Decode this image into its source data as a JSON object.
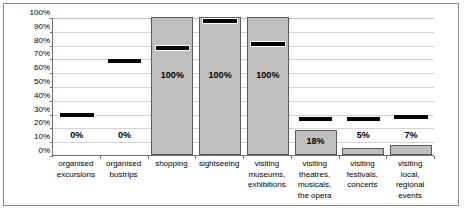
{
  "chart_data": {
    "type": "bar",
    "title": "",
    "xlabel": "",
    "ylabel": "",
    "ylim": [
      0,
      100
    ],
    "grid": true,
    "legend": "none",
    "y_ticks": [
      "0%",
      "10%",
      "20%",
      "30%",
      "40%",
      "50%",
      "60%",
      "70%",
      "80%",
      "90%",
      "100%"
    ],
    "y_tick_values": [
      0,
      10,
      20,
      30,
      40,
      50,
      60,
      70,
      80,
      90,
      100
    ],
    "categories": [
      "organised excursions",
      "organised bustrips",
      "shopping",
      "sightseeing",
      "visiting museums, exhibitions",
      "visiting theatres, musicals, the opera",
      "visiting festivals, concerts",
      "visiting local, regional events"
    ],
    "category_lines": [
      [
        "organised",
        "excursions"
      ],
      [
        "organised",
        "bustrips"
      ],
      [
        "shopping"
      ],
      [
        "sightseeing"
      ],
      [
        "visiting",
        "museums,",
        "exhibitions"
      ],
      [
        "visiting",
        "theatres,",
        "musicals,",
        "the opera"
      ],
      [
        "visiting",
        "festivals,",
        "concerts"
      ],
      [
        "visiting",
        "local,",
        "regional",
        "events"
      ]
    ],
    "series": [
      {
        "name": "bars",
        "type": "bar",
        "color": "#bfbfbf",
        "values": [
          0,
          0,
          100,
          100,
          100,
          18,
          5,
          7
        ],
        "labels": [
          "0%",
          "0%",
          "100%",
          "100%",
          "100%",
          "18%",
          "5%",
          "7%"
        ]
      },
      {
        "name": "markers",
        "type": "marker",
        "color": "#000000",
        "values": [
          30,
          69,
          78,
          98,
          81,
          27,
          27,
          28
        ]
      }
    ]
  },
  "colors": {
    "bar_fill": "#bfbfbf",
    "bar_stroke": "#5a5a5a",
    "marker": "#000000",
    "gridline": "#d4d4d4",
    "axis": "#6e6e6e",
    "frame": "#8a8a8a",
    "background": "#ffffff",
    "text": "#000000"
  }
}
